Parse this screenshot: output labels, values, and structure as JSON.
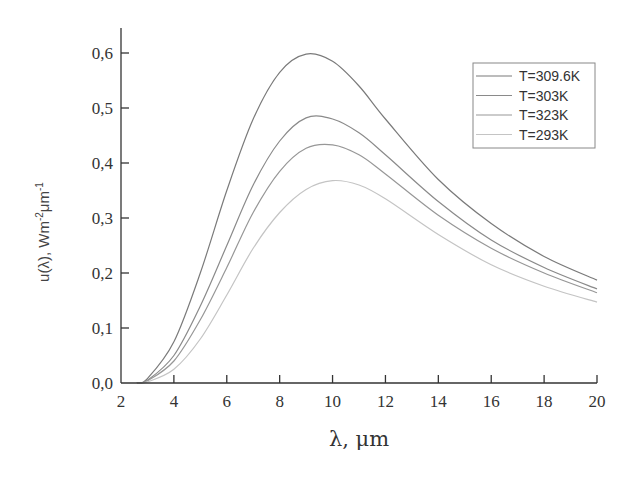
{
  "chart_data": {
    "type": "line",
    "title": "",
    "xlabel": "λ, μm",
    "ylabel": "u(λ), Wm⁻²μm⁻¹",
    "ylabel_parts": {
      "base": "u(λ), Wm",
      "sup1": "-2",
      "mid": "μm",
      "sup2": "-1"
    },
    "xlim": [
      2,
      20
    ],
    "ylim": [
      0,
      0.65
    ],
    "xticks": [
      2,
      4,
      6,
      8,
      10,
      12,
      14,
      16,
      18,
      20
    ],
    "xtick_labels": [
      "2",
      "4",
      "6",
      "8",
      "10",
      "12",
      "14",
      "16",
      "18",
      "20"
    ],
    "yticks": [
      0,
      0.1,
      0.2,
      0.3,
      0.4,
      0.5,
      0.6
    ],
    "ytick_labels": [
      "0,0",
      "0,1",
      "0,2",
      "0,3",
      "0,4",
      "0,5",
      "0,6"
    ],
    "grid": false,
    "legend_position": "upper right",
    "series": [
      {
        "name": "T=309.6K",
        "color": "#7a7a7a",
        "peak_x": 9.0,
        "peak_y": 0.598,
        "end_y": 0.187,
        "x": [
          2.6,
          3,
          4,
          5,
          6,
          7,
          8,
          9,
          10,
          11,
          12,
          14,
          16,
          18,
          20
        ],
        "values": [
          0.0,
          0.008,
          0.075,
          0.2,
          0.35,
          0.48,
          0.565,
          0.598,
          0.585,
          0.54,
          0.48,
          0.37,
          0.29,
          0.23,
          0.187
        ]
      },
      {
        "name": "T=303K",
        "color": "#8a8a8a",
        "peak_x": 9.4,
        "peak_y": 0.485,
        "end_y": 0.171,
        "x": [
          2.6,
          3,
          4,
          5,
          6,
          7,
          8,
          9,
          10,
          11,
          12,
          14,
          16,
          18,
          20
        ],
        "values": [
          0.0,
          0.005,
          0.05,
          0.14,
          0.25,
          0.36,
          0.44,
          0.482,
          0.48,
          0.455,
          0.415,
          0.33,
          0.26,
          0.21,
          0.171
        ]
      },
      {
        "name": "T=323K",
        "color": "#979797",
        "peak_x": 9.7,
        "peak_y": 0.434,
        "end_y": 0.164,
        "x": [
          2.6,
          3,
          4,
          5,
          6,
          7,
          8,
          9,
          10,
          11,
          12,
          14,
          16,
          18,
          20
        ],
        "values": [
          0.0,
          0.004,
          0.04,
          0.115,
          0.21,
          0.31,
          0.385,
          0.427,
          0.433,
          0.415,
          0.38,
          0.305,
          0.245,
          0.2,
          0.164
        ]
      },
      {
        "name": "T=293K",
        "color": "#c4c4c4",
        "peak_x": 10.0,
        "peak_y": 0.368,
        "end_y": 0.147,
        "x": [
          2.6,
          3,
          4,
          5,
          6,
          7,
          8,
          9,
          10,
          11,
          12,
          14,
          16,
          18,
          20
        ],
        "values": [
          0.0,
          0.002,
          0.025,
          0.08,
          0.16,
          0.245,
          0.31,
          0.352,
          0.368,
          0.36,
          0.335,
          0.27,
          0.215,
          0.176,
          0.147
        ]
      }
    ]
  }
}
